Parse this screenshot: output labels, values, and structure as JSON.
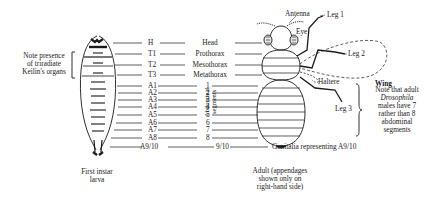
{
  "diagram": {
    "larva_note_lines": [
      "Note presence",
      "of triradiate",
      "Keilin's organs"
    ],
    "larva_caption_lines": [
      "First instar",
      "larva"
    ],
    "adult_caption_lines": [
      "Adult (appendages",
      "shown only on",
      "right-hand side)"
    ],
    "segment_codes": [
      "H",
      "T1",
      "T2",
      "T3",
      "A1",
      "A2",
      "A3",
      "A4",
      "A5",
      "A6",
      "A7",
      "A8",
      "A9/10"
    ],
    "segment_names": [
      "Head",
      "Prothorax",
      "Mesothorax",
      "Metathorax"
    ],
    "abdominal_numbers": [
      "1",
      "2",
      "3",
      "4",
      "5",
      "6",
      "7",
      "8",
      "9/10"
    ],
    "abdominal_label_line1": "Abdominal",
    "abdominal_label_line2": "segments",
    "genitalia_label": "Genitalia representing A9/10",
    "adult_labels": {
      "antenna": "Antenna",
      "eye": "Eye",
      "leg1": "Leg 1",
      "leg2": "Leg 2",
      "leg3": "Leg 3",
      "haltere": "Haltere",
      "wing": "Wing"
    },
    "adult_note": {
      "line1": "Note that adult",
      "line2_italic": "Drosophila",
      "line3": "males have 7",
      "line4": "rather than 8",
      "line5": "abdominal",
      "line6": "segments"
    }
  }
}
